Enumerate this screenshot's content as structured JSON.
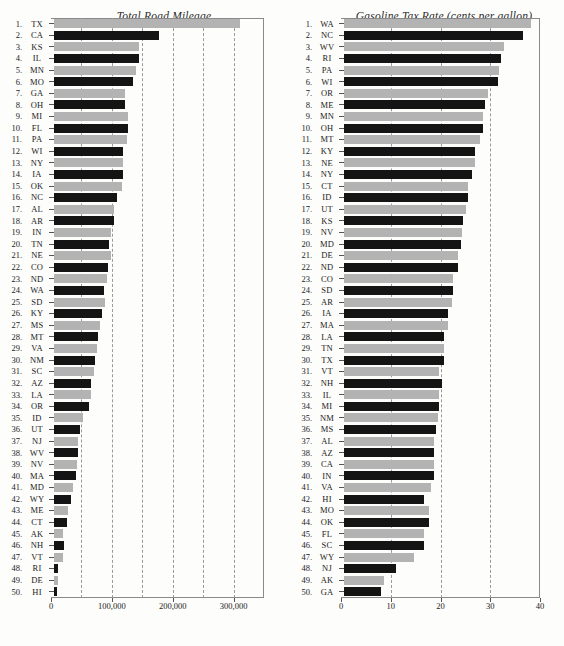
{
  "figure": {
    "panels": [
      {
        "id": "total-road-mileage",
        "title": "Total Road Mileage"
      },
      {
        "id": "gasoline-tax-rate",
        "title": "Gasoline Tax Rate (cents per gallon)"
      }
    ]
  },
  "chart_data": [
    {
      "type": "bar",
      "orientation": "horizontal",
      "title": "Total Road Mileage",
      "xlabel": "",
      "ylabel": "",
      "xlim": [
        0,
        350000
      ],
      "xticks": [
        0,
        100000,
        200000,
        300000
      ],
      "xticklabels": [
        "0",
        "100,000",
        "200,000",
        "300,000"
      ],
      "gridlines": [
        50000,
        100000,
        150000,
        200000,
        250000,
        300000
      ],
      "grid": true,
      "legend": "none",
      "bar_colors": [
        "#b3b3b3",
        "#141414"
      ],
      "categories": [
        "TX",
        "CA",
        "KS",
        "IL",
        "MN",
        "MO",
        "GA",
        "OH",
        "MI",
        "FL",
        "PA",
        "WI",
        "NY",
        "IA",
        "OK",
        "NC",
        "AL",
        "AR",
        "IN",
        "TN",
        "NE",
        "CO",
        "ND",
        "WA",
        "SD",
        "KY",
        "MS",
        "MT",
        "VA",
        "NM",
        "SC",
        "AZ",
        "LA",
        "OR",
        "ID",
        "UT",
        "NJ",
        "WV",
        "NV",
        "MA",
        "MD",
        "WY",
        "ME",
        "CT",
        "AK",
        "NH",
        "VT",
        "RI",
        "DE",
        "HI"
      ],
      "ranks": [
        "1.",
        "2.",
        "3.",
        "4.",
        "5.",
        "6.",
        "7.",
        "8.",
        "9.",
        "10.",
        "11.",
        "12.",
        "13.",
        "14.",
        "15.",
        "16.",
        "17.",
        "18.",
        "19.",
        "20.",
        "21.",
        "22.",
        "23.",
        "24.",
        "25.",
        "26.",
        "27.",
        "28.",
        "29.",
        "30.",
        "31.",
        "32.",
        "33.",
        "34.",
        "35.",
        "36.",
        "37.",
        "38.",
        "39.",
        "40.",
        "41.",
        "42.",
        "43.",
        "44.",
        "45.",
        "46.",
        "47.",
        "48.",
        "49.",
        "50."
      ],
      "values": [
        305000,
        173000,
        140000,
        139000,
        134000,
        130000,
        117000,
        117000,
        121000,
        121000,
        120000,
        114000,
        114000,
        113000,
        112000,
        103000,
        98000,
        99000,
        94000,
        91000,
        93000,
        88000,
        87000,
        82000,
        83000,
        79000,
        75000,
        73000,
        71000,
        68000,
        65000,
        60000,
        61000,
        57000,
        47000,
        43000,
        39000,
        39000,
        38000,
        36000,
        31000,
        28000,
        23000,
        21000,
        15000,
        16000,
        14000,
        6500,
        6200,
        4400
      ]
    },
    {
      "type": "bar",
      "orientation": "horizontal",
      "title": "Gasoline Tax Rate (cents per gallon)",
      "xlabel": "",
      "ylabel": "",
      "xlim": [
        0,
        40
      ],
      "xticks": [
        0,
        10,
        20,
        30,
        40
      ],
      "xticklabels": [
        "0",
        "10",
        "20",
        "30",
        "40"
      ],
      "gridlines": [
        10,
        20,
        30
      ],
      "grid": true,
      "legend": "none",
      "bar_colors": [
        "#b3b3b3",
        "#141414"
      ],
      "categories": [
        "WA",
        "NC",
        "WV",
        "RI",
        "PA",
        "WI",
        "OR",
        "ME",
        "MN",
        "OH",
        "MT",
        "KY",
        "NE",
        "NY",
        "CT",
        "ID",
        "UT",
        "KS",
        "NV",
        "MD",
        "DE",
        "ND",
        "CO",
        "SD",
        "AR",
        "IA",
        "MA",
        "LA",
        "TN",
        "TX",
        "VT",
        "NH",
        "IL",
        "MI",
        "NM",
        "MS",
        "AL",
        "AZ",
        "CA",
        "IN",
        "VA",
        "HI",
        "MO",
        "OK",
        "FL",
        "SC",
        "WY",
        "NJ",
        "AK",
        "GA"
      ],
      "ranks": [
        "1.",
        "2.",
        "3.",
        "4.",
        "5.",
        "6.",
        "7.",
        "8.",
        "9.",
        "10.",
        "11.",
        "12.",
        "13.",
        "14.",
        "15.",
        "16.",
        "17.",
        "18.",
        "19.",
        "20.",
        "21.",
        "22.",
        "23.",
        "24.",
        "25.",
        "26.",
        "27.",
        "28.",
        "29.",
        "30.",
        "31.",
        "32.",
        "33.",
        "34.",
        "35.",
        "36.",
        "37.",
        "38.",
        "39.",
        "40.",
        "41.",
        "42.",
        "43.",
        "44.",
        "45.",
        "46.",
        "47.",
        "48.",
        "49.",
        "50."
      ],
      "values": [
        37.5,
        35.9,
        32.2,
        31.5,
        31.2,
        30.9,
        29.0,
        28.4,
        28.0,
        28.0,
        27.3,
        26.4,
        26.4,
        25.8,
        25.0,
        25.0,
        24.5,
        24.0,
        23.8,
        23.5,
        23.0,
        23.0,
        22.0,
        22.0,
        21.7,
        21.0,
        21.0,
        20.0,
        20.0,
        20.0,
        19.0,
        19.6,
        19.0,
        19.0,
        18.9,
        18.4,
        18.0,
        18.0,
        18.0,
        18.0,
        17.5,
        16.0,
        17.0,
        17.0,
        16.0,
        16.0,
        14.0,
        10.5,
        8.0,
        7.5
      ]
    }
  ]
}
